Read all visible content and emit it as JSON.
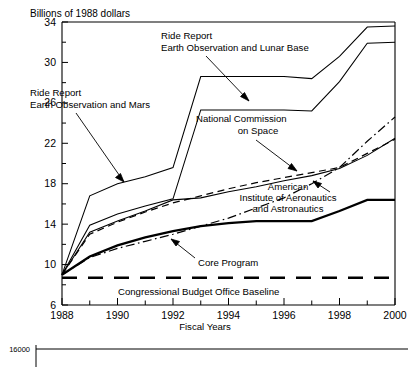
{
  "chart_data": {
    "type": "line",
    "title": "",
    "ylabel": "Billions of 1988 dollars",
    "xlabel": "Fiscal Years",
    "xlim": [
      1988,
      2000
    ],
    "ylim": [
      6,
      34
    ],
    "yticks": [
      6,
      10,
      14,
      18,
      22,
      26,
      30,
      34
    ],
    "yticks_minor": [
      8,
      12,
      16,
      20,
      24,
      28,
      32
    ],
    "xticks": [
      1988,
      1990,
      1992,
      1994,
      1996,
      1998,
      2000
    ],
    "xticks_minor": [
      1989,
      1991,
      1993,
      1995,
      1997,
      1999
    ],
    "grid": false,
    "legend": "annotations",
    "x": [
      1988,
      1989,
      1990,
      1991,
      1992,
      1993,
      1994,
      1995,
      1996,
      1997,
      1998,
      1999,
      2000
    ],
    "series": [
      {
        "name": "Ride Report Earth Observation and Lunar Base",
        "style": "solid-thin",
        "values": [
          9.0,
          16.8,
          18.0,
          18.7,
          19.6,
          28.6,
          28.6,
          28.6,
          28.6,
          28.4,
          30.6,
          33.5,
          33.6
        ]
      },
      {
        "name": "Ride Report Earth Observation and Mars",
        "style": "solid-thin",
        "values": [
          9.0,
          13.9,
          15.0,
          15.8,
          16.5,
          25.3,
          25.3,
          25.3,
          25.3,
          25.2,
          28.1,
          31.9,
          32.0
        ]
      },
      {
        "name": "National Commission on Space",
        "style": "solid-thin",
        "values": [
          9.0,
          13.2,
          14.3,
          15.3,
          16.4,
          16.6,
          17.2,
          17.7,
          18.3,
          18.8,
          19.5,
          20.8,
          22.5
        ]
      },
      {
        "name": "American Institute of Aeronautics and Astronautics",
        "style": "dashed",
        "values": [
          9.0,
          13.0,
          14.2,
          15.2,
          16.1,
          16.8,
          17.5,
          18.1,
          18.6,
          19.1,
          19.6,
          21.0,
          22.4
        ]
      },
      {
        "name": "American Institute of Aeronautics and Astronautics (alt)",
        "style": "dash-dot",
        "values": [
          9.0,
          10.7,
          11.6,
          12.3,
          13.0,
          13.8,
          14.6,
          15.6,
          16.6,
          18.0,
          19.6,
          22.2,
          24.6
        ]
      },
      {
        "name": "Core Program",
        "style": "solid-bold",
        "values": [
          9.0,
          10.8,
          11.9,
          12.7,
          13.3,
          13.8,
          14.1,
          14.3,
          14.3,
          14.3,
          15.3,
          16.4,
          16.4
        ]
      },
      {
        "name": "Congressional Budget Office Baseline",
        "style": "bold-dashed",
        "values": [
          8.7,
          8.7,
          8.7,
          8.7,
          8.7,
          8.7,
          8.7,
          8.7,
          8.7,
          8.7,
          8.7,
          8.7,
          8.7
        ]
      }
    ],
    "annotations": [
      {
        "id": "ride-lunar",
        "lines": [
          "Ride Report",
          "Earth Observation and Lunar Base"
        ]
      },
      {
        "id": "ride-mars",
        "lines": [
          "Ride Report",
          "Earth Observation and Mars"
        ]
      },
      {
        "id": "ncos",
        "lines": [
          "National Commission",
          "on Space"
        ]
      },
      {
        "id": "aiaa",
        "lines": [
          "American",
          "Institute of Aeronautics",
          "and Astronautics"
        ]
      },
      {
        "id": "core",
        "lines": [
          "Core Program"
        ]
      },
      {
        "id": "cbo",
        "lines": [
          "Congressional Budget Office Baseline"
        ]
      }
    ]
  },
  "bottom_chart": {
    "ytick_top": "16000"
  }
}
